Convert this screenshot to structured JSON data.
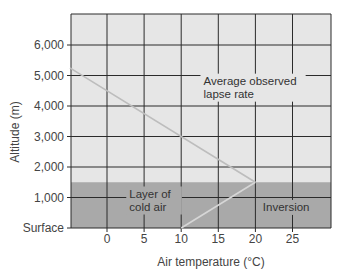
{
  "chart_data": {
    "type": "line",
    "title": "",
    "xlabel": "Air temperature (°C)",
    "ylabel": "Altitude (m)",
    "xlim": [
      -5,
      30
    ],
    "ylim": [
      0,
      6900
    ],
    "x_ticks": [
      0,
      5,
      10,
      15,
      20,
      25
    ],
    "x_tick_labels": [
      "0",
      "5",
      "10",
      "15",
      "20",
      "25"
    ],
    "y_ticks": [
      0,
      1000,
      2000,
      3000,
      4000,
      5000,
      6000
    ],
    "y_tick_labels": [
      "Surface",
      "1,000",
      "2,000",
      "3,000",
      "4,000",
      "5,000",
      "6,000"
    ],
    "grid": true,
    "series": [
      {
        "name": "Average observed lapse rate",
        "x": [
          -5,
          20
        ],
        "y": [
          5250,
          1500
        ],
        "color": "#bdbdbd"
      },
      {
        "name": "Inversion",
        "x": [
          10,
          20
        ],
        "y": [
          0,
          1500
        ],
        "color": "#d6d6d6"
      }
    ],
    "shaded_regions": [
      {
        "name": "Layer of cold air",
        "y_from": 0,
        "y_to": 1500,
        "color": "#a9a9a9"
      }
    ],
    "annotations": [
      {
        "text_lines": [
          "Average observed",
          "lapse rate"
        ],
        "x": 13,
        "y": 4700
      },
      {
        "text_lines": [
          "Layer of",
          "cold air"
        ],
        "x": 3,
        "y": 1000
      },
      {
        "text_lines": [
          "Inversion"
        ],
        "x": 21,
        "y": 560
      }
    ],
    "colors": {
      "plot_background": "#e6e6e6",
      "shaded_layer": "#a9a9a9",
      "grid": "#2b2b2b"
    }
  }
}
